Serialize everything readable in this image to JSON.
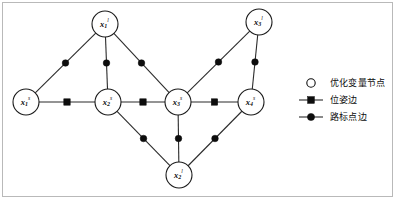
{
  "figure": {
    "type": "graph-diagram",
    "background_color": "#ffffff",
    "frame_color": "#b9b9b9",
    "node_stroke_color": "#1a1a1a",
    "edge_color": "#2b2b2b",
    "marker_color": "#0d0d0d"
  },
  "graph": {
    "nodes": [
      {
        "id": "x1s",
        "base": "x",
        "sub": "1",
        "sup": "s",
        "x": 26,
        "y": 102,
        "r": 13
      },
      {
        "id": "x2s",
        "base": "x",
        "sub": "2",
        "sup": "s",
        "x": 108,
        "y": 102,
        "r": 13
      },
      {
        "id": "x3s",
        "base": "x",
        "sub": "3",
        "sup": "s",
        "x": 178,
        "y": 102,
        "r": 13
      },
      {
        "id": "x4s",
        "base": "x",
        "sub": "4",
        "sup": "s",
        "x": 251,
        "y": 102,
        "r": 13
      },
      {
        "id": "x1l",
        "base": "x",
        "sub": "1",
        "sup": "l",
        "x": 105,
        "y": 24,
        "r": 13
      },
      {
        "id": "x3l",
        "base": "x",
        "sub": "3",
        "sup": "l",
        "x": 259,
        "y": 22,
        "r": 13
      },
      {
        "id": "x2l",
        "base": "x",
        "sub": "2",
        "sup": "l",
        "x": 179,
        "y": 175,
        "r": 13
      }
    ],
    "edges": [
      {
        "from": "x1s",
        "to": "x2s",
        "marker": "square",
        "kind": "pose"
      },
      {
        "from": "x2s",
        "to": "x3s",
        "marker": "square",
        "kind": "pose"
      },
      {
        "from": "x3s",
        "to": "x4s",
        "marker": "square",
        "kind": "pose"
      },
      {
        "from": "x1s",
        "to": "x1l",
        "marker": "circle",
        "kind": "landmark"
      },
      {
        "from": "x2s",
        "to": "x1l",
        "marker": "circle",
        "kind": "landmark"
      },
      {
        "from": "x3s",
        "to": "x1l",
        "marker": "circle",
        "kind": "landmark"
      },
      {
        "from": "x3s",
        "to": "x3l",
        "marker": "circle",
        "kind": "landmark"
      },
      {
        "from": "x4s",
        "to": "x3l",
        "marker": "circle",
        "kind": "landmark"
      },
      {
        "from": "x2s",
        "to": "x2l",
        "marker": "circle",
        "kind": "landmark"
      },
      {
        "from": "x3s",
        "to": "x2l",
        "marker": "circle",
        "kind": "landmark"
      },
      {
        "from": "x4s",
        "to": "x2l",
        "marker": "circle",
        "kind": "landmark"
      }
    ]
  },
  "legend": {
    "items": [
      {
        "symbol": "open-circle",
        "label": "优化变量节点"
      },
      {
        "symbol": "line-square",
        "label": "位姿边"
      },
      {
        "symbol": "line-circle",
        "label": "路标点边"
      }
    ]
  }
}
